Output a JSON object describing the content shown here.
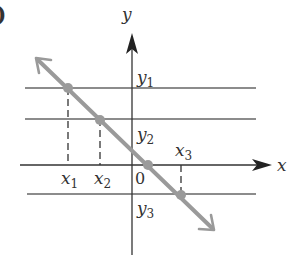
{
  "figure": {
    "panel_label_partial": ")",
    "axes": {
      "x_label": "x",
      "y_label": "y",
      "origin_label": "0"
    },
    "horizontal_lines": [
      {
        "name": "y1",
        "label_base": "y",
        "label_sub": "1"
      },
      {
        "name": "y2",
        "label_base": "y",
        "label_sub": "2"
      },
      {
        "name": "y3",
        "label_base": "y",
        "label_sub": "3"
      }
    ],
    "x_markers": [
      {
        "name": "x1",
        "label_base": "x",
        "label_sub": "1"
      },
      {
        "name": "x2",
        "label_base": "x",
        "label_sub": "2"
      },
      {
        "name": "x3",
        "label_base": "x",
        "label_sub": "3"
      }
    ],
    "line": {
      "description": "decreasing straight line with arrows on both ends",
      "color": "#9a9a9a"
    },
    "colors": {
      "axis": "#333333",
      "grid": "#555555",
      "line": "#9a9a9a",
      "point": "#9a9a9a"
    }
  }
}
